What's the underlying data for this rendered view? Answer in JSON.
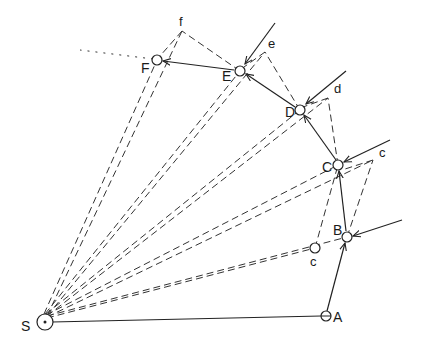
{
  "diagram": {
    "labels": {
      "S": "S",
      "A": "A",
      "B": "B",
      "c_lower": "c",
      "C": "C",
      "c_upper": "c",
      "D": "D",
      "d": "d",
      "E": "E",
      "e": "e",
      "F": "F",
      "f": "f"
    },
    "points": {
      "S": [
        45,
        322
      ],
      "A": [
        326,
        316
      ],
      "B": [
        347,
        237
      ],
      "c_lower": [
        315,
        248
      ],
      "C": [
        338,
        165
      ],
      "c_upper": [
        373,
        160
      ],
      "D": [
        300,
        110
      ],
      "d": [
        328,
        98
      ],
      "E": [
        240,
        71
      ],
      "e": [
        265,
        52
      ],
      "F": [
        157,
        60
      ],
      "f": [
        182,
        31
      ]
    },
    "legend": {
      "solid": "actual path / impulse direction",
      "dashed": "radius vectors and inertial continuation"
    }
  }
}
